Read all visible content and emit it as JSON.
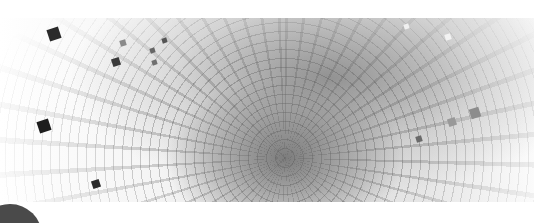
{
  "image": {
    "description": "Abstract grayscale banner: warped grid tunnel with scattered squares",
    "palette": {
      "background": "#ffffff",
      "core": "#6e6e6e",
      "grid": "#5a5a5a",
      "dark_square": "#2e2e2e",
      "circle": "#4a4a4a"
    },
    "squares": [
      {
        "x": 48,
        "y": 28,
        "size": 12,
        "color": "#2a2a2a"
      },
      {
        "x": 112,
        "y": 58,
        "size": 8,
        "color": "#3a3a3a"
      },
      {
        "x": 120,
        "y": 40,
        "size": 6,
        "color": "#8a8a8a"
      },
      {
        "x": 162,
        "y": 38,
        "size": 5,
        "color": "#555555"
      },
      {
        "x": 38,
        "y": 120,
        "size": 12,
        "color": "#1e1e1e"
      },
      {
        "x": 150,
        "y": 48,
        "size": 5,
        "color": "#666666"
      },
      {
        "x": 152,
        "y": 60,
        "size": 5,
        "color": "#707070"
      },
      {
        "x": 470,
        "y": 108,
        "size": 10,
        "color": "#8c8c8c"
      },
      {
        "x": 448,
        "y": 118,
        "size": 8,
        "color": "#999999"
      },
      {
        "x": 416,
        "y": 136,
        "size": 6,
        "color": "#6a6a6a"
      },
      {
        "x": 404,
        "y": 24,
        "size": 5,
        "color": "#f0f0f0"
      },
      {
        "x": 445,
        "y": 34,
        "size": 6,
        "color": "#f2f2f2"
      },
      {
        "x": 92,
        "y": 180,
        "size": 8,
        "color": "#2a2a2a"
      }
    ]
  }
}
